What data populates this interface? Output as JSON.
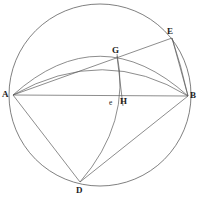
{
  "figure": {
    "canvas": {
      "width": 201,
      "height": 198,
      "background": "#ffffff"
    },
    "stroke_color": "#5b5b5b",
    "label_color": "#1c1c1c",
    "circle": {
      "cx": 100,
      "cy": 95,
      "r": 91
    },
    "points": {
      "A": {
        "x": 13,
        "y": 95,
        "label": "A",
        "label_x": 2,
        "label_y": 90
      },
      "B": {
        "x": 188,
        "y": 96,
        "label": "B",
        "label_x": 190,
        "label_y": 91
      },
      "D": {
        "x": 80,
        "y": 182,
        "label": "D",
        "label_x": 76,
        "label_y": 186
      },
      "E": {
        "x": 172,
        "y": 38,
        "label": "E",
        "label_x": 167,
        "label_y": 27
      },
      "G": {
        "x": 117,
        "y": 57,
        "label": "G",
        "label_x": 112,
        "label_y": 46
      },
      "H": {
        "x": 122,
        "y": 96,
        "label": "H",
        "label_x": 120,
        "label_y": 97
      },
      "e": {
        "x": 113,
        "y": 96,
        "label": "e",
        "label_x": 109,
        "label_y": 99
      }
    },
    "segments": [
      {
        "name": "segment-AB",
        "from": "A",
        "to": "B"
      },
      {
        "name": "segment-AE",
        "from": "A",
        "to": "E"
      },
      {
        "name": "segment-EB",
        "from": "E",
        "to": "B"
      },
      {
        "name": "segment-AD",
        "from": "A",
        "to": "D"
      },
      {
        "name": "segment-GH",
        "from": "G",
        "to": "H"
      },
      {
        "name": "segment-DB",
        "from": "D",
        "to": "B"
      }
    ],
    "arcs": [
      {
        "name": "arc-A-to-B-upper",
        "d": "M 13 95 Q 100 17 188 96"
      },
      {
        "name": "arc-A-to-B-lower",
        "d": "M 13 95 Q 105 45 188 96"
      },
      {
        "name": "arc-G-to-D",
        "d": "M 117 55 Q 128 125 80 182"
      },
      {
        "name": "arc-E-to-B",
        "d": "M 172 38 Q 182 66 188 96"
      }
    ]
  }
}
